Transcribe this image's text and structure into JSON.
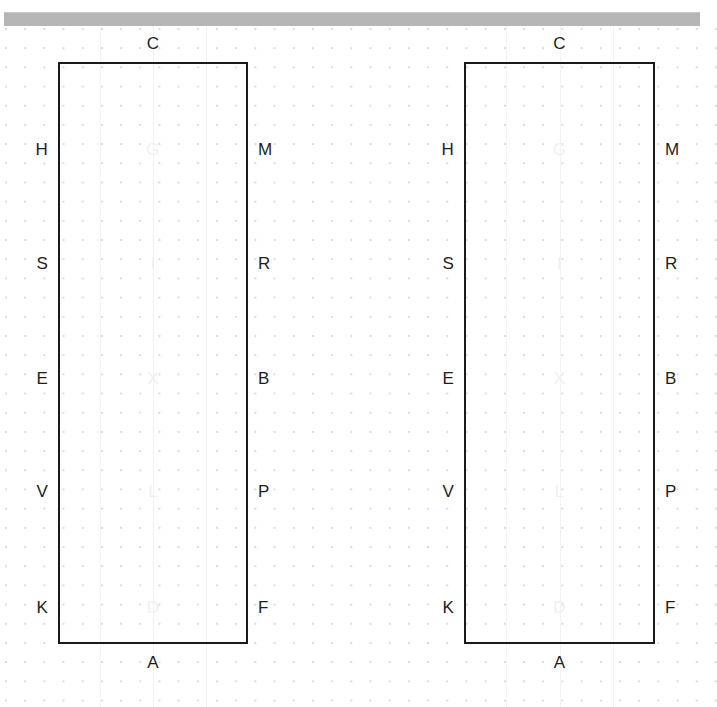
{
  "window": {
    "scrollbar_name": "horizontal-scrollbar"
  },
  "canvas": {
    "background": "#ffffff",
    "dot_color": "#d9d9de",
    "grid_spacing_px": 19,
    "stroke_color": "#1a1a1a",
    "label_color": "#1e1e1e",
    "faint_label_color": "#f0f0f2"
  },
  "shapes": [
    {
      "id": "shape-left",
      "name": "rectangle-left",
      "x": 58,
      "y": 38,
      "width": 190,
      "height": 582,
      "top_label": "C",
      "bottom_label": "A",
      "left_labels": [
        "H",
        "S",
        "E",
        "V",
        "K"
      ],
      "right_labels": [
        "M",
        "R",
        "B",
        "P",
        "F"
      ],
      "inner_labels": [
        "G",
        "I",
        "X",
        "L",
        "D"
      ],
      "row_offsets": [
        87,
        201,
        316,
        429,
        545
      ]
    },
    {
      "id": "shape-right",
      "name": "rectangle-right",
      "x": 464,
      "y": 38,
      "width": 191,
      "height": 582,
      "top_label": "C",
      "bottom_label": "A",
      "left_labels": [
        "H",
        "S",
        "E",
        "V",
        "K"
      ],
      "right_labels": [
        "M",
        "R",
        "B",
        "P",
        "F"
      ],
      "inner_labels": [
        "G",
        "I",
        "X",
        "L",
        "D"
      ],
      "row_offsets": [
        87,
        201,
        316,
        429,
        545
      ]
    }
  ]
}
